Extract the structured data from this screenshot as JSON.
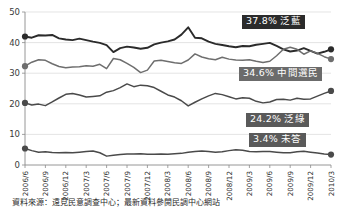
{
  "chart_data": {
    "type": "line",
    "title": "",
    "xlabel": "",
    "ylabel": "",
    "ylim": [
      0,
      50
    ],
    "grid": true,
    "legend_position": "inline-right-callouts",
    "categories": [
      "2006/6",
      "2006/7",
      "2006/8",
      "2006/9",
      "2006/10",
      "2006/11",
      "2006/12",
      "2007/1",
      "2007/2",
      "2007/3",
      "2007/4",
      "2007/5",
      "2007/6",
      "2007/7",
      "2007/8",
      "2007/9",
      "2007/10",
      "2007/11",
      "2007/12",
      "2008/1",
      "2008/2",
      "2008/3",
      "2008/4",
      "2008/5",
      "2008/6",
      "2008/7",
      "2008/8",
      "2008/9",
      "2008/10",
      "2008/11",
      "2008/12",
      "2009/1",
      "2009/2",
      "2009/3",
      "2009/4",
      "2009/5",
      "2009/6",
      "2009/7",
      "2009/8",
      "2009/9",
      "2009/10",
      "2009/11",
      "2009/12",
      "2010/1",
      "2010/2",
      "2010/3"
    ],
    "tick_labels": [
      "2006/6",
      "2006/9",
      "2006/12",
      "2007/3",
      "2007/6",
      "2007/9",
      "2007/12",
      "2008/3",
      "2008/6",
      "2008/9",
      "2008/12",
      "2009/3",
      "2009/6",
      "2009/9",
      "2009/12",
      "2010/3"
    ],
    "ytick_labels": [
      "0",
      "10",
      "20",
      "30",
      "40",
      "50"
    ],
    "yticks": [
      0,
      10,
      20,
      30,
      40,
      50
    ],
    "series": [
      {
        "name": "泛藍",
        "color": "#2b2b2b",
        "final_value": 37.8,
        "values": [
          42.0,
          41.6,
          42.4,
          42.3,
          42.5,
          41.4,
          41.0,
          40.8,
          41.3,
          40.8,
          40.3,
          39.9,
          39.2,
          36.9,
          38.2,
          38.7,
          38.4,
          38.0,
          38.3,
          39.4,
          40.0,
          40.4,
          41.0,
          42.6,
          45.0,
          41.6,
          41.4,
          40.3,
          39.6,
          39.2,
          38.8,
          38.5,
          38.9,
          38.8,
          39.3,
          39.6,
          39.9,
          38.9,
          37.8,
          37.1,
          37.4,
          38.2,
          37.3,
          36.4,
          37.0,
          37.8
        ]
      },
      {
        "name": "中間選民",
        "color": "#6e6e6e",
        "final_value": 34.6,
        "values": [
          32.3,
          33.6,
          34.4,
          34.2,
          33.1,
          32.2,
          31.8,
          32.0,
          32.1,
          32.4,
          32.3,
          32.9,
          31.5,
          34.8,
          34.4,
          33.2,
          31.9,
          30.2,
          31.0,
          34.0,
          34.2,
          33.8,
          33.4,
          33.2,
          34.3,
          36.3,
          35.3,
          34.7,
          34.4,
          35.2,
          34.6,
          34.3,
          34.2,
          34.4,
          33.9,
          33.5,
          33.9,
          35.7,
          37.8,
          38.5,
          37.8,
          36.2,
          37.3,
          36.5,
          35.4,
          34.6
        ]
      },
      {
        "name": "泛綠",
        "color": "#4a4a4a",
        "final_value": 24.2,
        "values": [
          20.3,
          19.6,
          19.9,
          19.4,
          20.6,
          21.9,
          23.1,
          23.4,
          22.9,
          22.2,
          22.4,
          22.6,
          23.8,
          24.3,
          25.3,
          26.5,
          25.6,
          26.1,
          25.9,
          25.3,
          24.1,
          22.9,
          22.2,
          21.0,
          19.3,
          20.5,
          21.6,
          22.6,
          23.4,
          23.0,
          22.3,
          21.6,
          22.0,
          21.8,
          20.8,
          20.3,
          20.6,
          21.4,
          21.5,
          21.2,
          21.8,
          21.5,
          21.6,
          22.5,
          23.4,
          24.2
        ]
      },
      {
        "name": "未答",
        "color": "#4a4a4a",
        "final_value": 3.4,
        "values": [
          5.4,
          4.7,
          4.2,
          4.3,
          4.1,
          4.0,
          4.1,
          4.0,
          4.2,
          4.4,
          4.6,
          4.0,
          2.9,
          3.2,
          3.4,
          3.6,
          3.6,
          3.7,
          3.5,
          3.5,
          3.6,
          3.5,
          3.7,
          3.8,
          4.2,
          4.4,
          4.6,
          4.4,
          4.2,
          4.3,
          4.7,
          5.0,
          4.8,
          4.4,
          4.3,
          4.4,
          4.4,
          4.2,
          4.0,
          4.0,
          4.3,
          4.5,
          4.2,
          3.9,
          3.6,
          3.4
        ]
      }
    ]
  },
  "callouts": {
    "blue": "37.8% 泛藍",
    "middle": "34.6% 中間選民",
    "green": "24.2% 泛綠",
    "none": "3.4% 未答"
  },
  "source_note": "資料來源：遠見民意調查中心；最新資料參閱民調中心網站"
}
